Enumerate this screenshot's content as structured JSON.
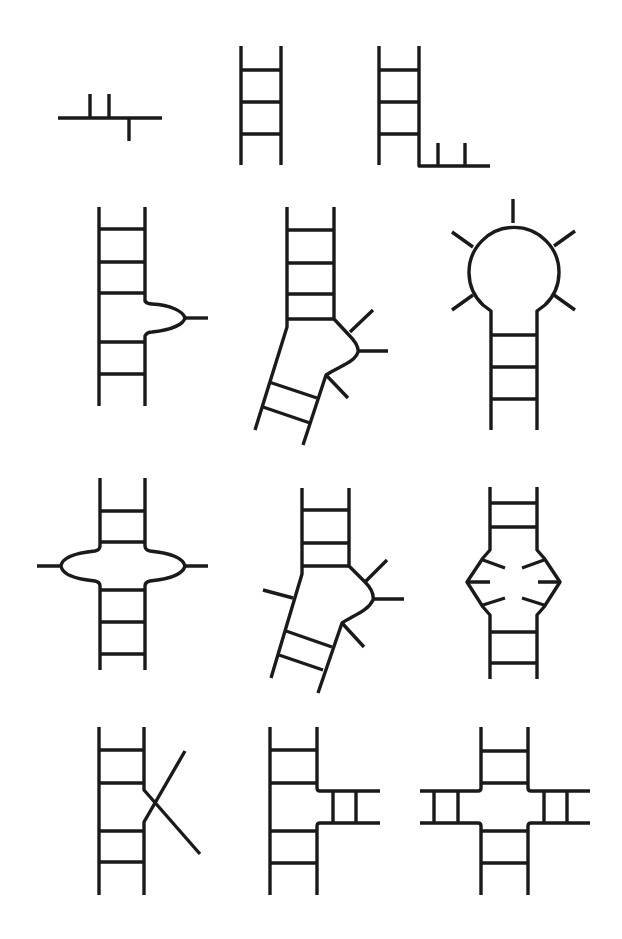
{
  "figure": {
    "layout": {
      "rows": 4,
      "columns": 3
    },
    "stroke_color": "#1a1a1a",
    "background_color": "#ffffff",
    "panels": [
      {
        "id": 1,
        "name": "single-strand",
        "label": "Single strand with unpaired bases"
      },
      {
        "id": 2,
        "name": "double-helix",
        "label": "Double-stranded helix (stem)"
      },
      {
        "id": 3,
        "name": "dangling-end",
        "label": "Helix with single-stranded overhang"
      },
      {
        "id": 4,
        "name": "bulge-loop",
        "label": "Bulge loop"
      },
      {
        "id": 5,
        "name": "bulge-kinked-helix",
        "label": "Bulge causing helix kink"
      },
      {
        "id": 6,
        "name": "hairpin-loop",
        "label": "Hairpin (stem-loop)"
      },
      {
        "id": 7,
        "name": "symmetric-internal-loop",
        "label": "Symmetric internal loop"
      },
      {
        "id": 8,
        "name": "asymmetric-internal-loop",
        "label": "Asymmetric internal loop with kink"
      },
      {
        "id": 9,
        "name": "internal-loop-mismatch",
        "label": "Internal loop with non-canonical pairs"
      },
      {
        "id": 10,
        "name": "strand-crossover",
        "label": "Strand exchange / crossover"
      },
      {
        "id": 11,
        "name": "three-way-junction",
        "label": "Three-way junction"
      },
      {
        "id": 12,
        "name": "four-way-junction",
        "label": "Four-way junction"
      }
    ]
  }
}
